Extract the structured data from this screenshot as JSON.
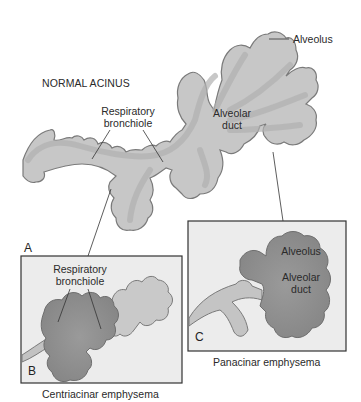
{
  "figure": {
    "panel_a": {
      "letter": "A",
      "title": "NORMAL ACINUS",
      "labels": {
        "alveolus": "Alveolus",
        "respiratory_bronchiole_line1": "Respiratory",
        "respiratory_bronchiole_line2": "bronchiole",
        "alveolar_duct_line1": "Alveolar",
        "alveolar_duct_line2": "duct"
      }
    },
    "panel_b": {
      "letter": "B",
      "labels": {
        "respiratory_bronchiole_line1": "Respiratory",
        "respiratory_bronchiole_line2": "bronchiole"
      },
      "caption": "Centriacinar emphysema"
    },
    "panel_c": {
      "letter": "C",
      "labels": {
        "alveolus": "Alveolus",
        "alveolar_duct_line1": "Alveolar",
        "alveolar_duct_line2": "duct"
      },
      "caption": "Panacinar emphysema"
    },
    "colors": {
      "airway_fill": "#c9c9c9",
      "airway_core": "#b5b5b5",
      "airway_outline": "#7a7a7a",
      "emphysema_fill": "#8f8f8f",
      "panel_bg": "#ececec",
      "panel_border": "#333333"
    }
  }
}
